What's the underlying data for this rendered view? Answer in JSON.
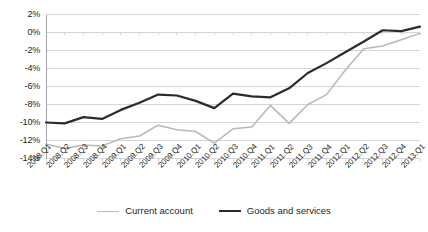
{
  "chart_data": {
    "type": "line",
    "title": "",
    "subtitle": "",
    "xlabel": "",
    "ylabel": "",
    "ylim": [
      -14,
      2
    ],
    "ytick_step": 2,
    "grid": true,
    "legend_position": "bottom",
    "ytick_labels": [
      "2%",
      "0%",
      "-2%",
      "-4%",
      "-6%",
      "-8%",
      "-10%",
      "-12%",
      "-14%"
    ],
    "ytick_values": [
      2,
      0,
      -2,
      -4,
      -6,
      -8,
      -10,
      -12,
      -14
    ],
    "categories": [
      "2008.Q1",
      "2008.Q2",
      "2008.Q3",
      "2008.Q4",
      "2009.Q1",
      "2009.Q2",
      "2009.Q3",
      "2009.Q4",
      "2010.Q1",
      "2010.Q2",
      "2010.Q3",
      "2010.Q4",
      "2011.Q1",
      "2011.Q2",
      "2011.Q3",
      "2011.Q4",
      "2012.Q1",
      "2012.Q2",
      "2012.Q3",
      "2012.Q4",
      "2013.Q1"
    ],
    "series": [
      {
        "name": "Current account",
        "color": "#b8b8b8",
        "width": 1.5,
        "values": [
          -12.4,
          -12.9,
          -12.5,
          -12.6,
          -11.8,
          -11.5,
          -10.3,
          -10.8,
          -11.0,
          -12.3,
          -10.7,
          -10.5,
          -8.1,
          -10.1,
          -8.0,
          -6.9,
          -4.2,
          -1.8,
          -1.5,
          -0.8,
          -0.1
        ]
      },
      {
        "name": "Goods and services",
        "color": "#2b2b2b",
        "width": 2.2,
        "values": [
          -10.0,
          -10.1,
          -9.4,
          -9.6,
          -8.6,
          -7.8,
          -6.9,
          -7.0,
          -7.6,
          -8.4,
          -6.8,
          -7.1,
          -7.2,
          -6.2,
          -4.5,
          -3.4,
          -2.2,
          -1.0,
          0.25,
          0.15,
          0.65
        ]
      }
    ]
  },
  "legend": {
    "items": [
      {
        "label": "Current account"
      },
      {
        "label": "Goods and services"
      }
    ]
  }
}
